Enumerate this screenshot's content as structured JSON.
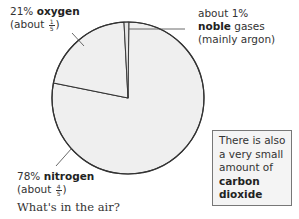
{
  "chart_data": {
    "type": "pie",
    "title": "",
    "caption": "What's in the air?",
    "slices": [
      {
        "name": "nitrogen",
        "value": 78,
        "label_pct": "78%",
        "label_name": "nitrogen",
        "label_approx_prefix": "(about",
        "label_approx_num": "4",
        "label_approx_den": "5",
        "label_approx_suffix": ")",
        "color": "#efefef"
      },
      {
        "name": "oxygen",
        "value": 21,
        "label_pct": "21%",
        "label_name": "oxygen",
        "label_approx_prefix": "(about",
        "label_approx_num": "1",
        "label_approx_den": "5",
        "label_approx_suffix": ")",
        "color": "#efefef"
      },
      {
        "name": "noble gases",
        "value": 1,
        "label_line1": "about 1%",
        "label_bold": "noble",
        "label_rest": " gases",
        "label_line3": "(mainly argon)",
        "color": "#e6e6e6"
      }
    ],
    "start_angle_deg": -3,
    "direction": "counterclockwise-for-oxygen",
    "outline_color": "#333333",
    "note": {
      "line1": "There is also",
      "line2": "a very small",
      "line3": "amount of",
      "bold1": "carbon",
      "bold2": "dioxide"
    }
  }
}
